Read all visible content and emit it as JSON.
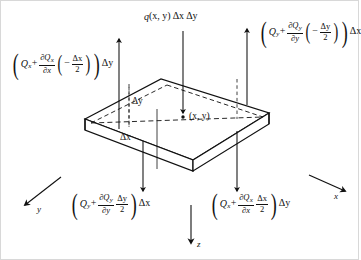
{
  "figure": {
    "background": "#ffffff",
    "stroke": "#111111",
    "width": 359,
    "height": 260
  },
  "load": {
    "label_plain": "q(x, y) Δx Δy",
    "symbol": "q",
    "args": "(x, y)",
    "factor1": "Δx",
    "factor2": "Δy",
    "direction": "down"
  },
  "forces": {
    "left": {
      "name": "shear-force-x-minus",
      "base": "Q",
      "sub": "x",
      "partial_num": "∂Q",
      "partial_num_sub": "x",
      "partial_den": "∂x",
      "offset_num": "Δx",
      "offset_den": "2",
      "offset_sign": "−",
      "multiplier": "Δy",
      "direction": "up",
      "plain": "(Q_x + ∂Q_x/∂x (−Δx/2)) Δy"
    },
    "top_right": {
      "name": "shear-force-y-minus",
      "base": "Q",
      "sub": "y",
      "partial_num": "∂Q",
      "partial_num_sub": "y",
      "partial_den": "∂y",
      "offset_num": "Δy",
      "offset_den": "2",
      "offset_sign": "−",
      "multiplier": "Δx",
      "direction": "up",
      "plain": "(Q_y + ∂Q_y/∂y (−Δy/2)) Δx"
    },
    "bottom_left": {
      "name": "shear-force-y-plus",
      "base": "Q",
      "sub": "y",
      "partial_num": "∂Q",
      "partial_num_sub": "y",
      "partial_den": "∂y",
      "offset_num": "Δy",
      "offset_den": "2",
      "offset_sign": "",
      "multiplier": "Δx",
      "direction": "down",
      "plain": "(Q_y + ∂Q_y/∂y Δy/2) Δx"
    },
    "bottom_right": {
      "name": "shear-force-x-plus",
      "base": "Q",
      "sub": "x",
      "partial_num": "∂Q",
      "partial_num_sub": "x",
      "partial_den": "∂x",
      "offset_num": "Δx",
      "offset_den": "2",
      "offset_sign": "",
      "multiplier": "Δy",
      "direction": "down",
      "plain": "(Q_x + ∂Q_x/∂x Δx/2) Δy"
    }
  },
  "dimensions": {
    "dx": "Δx",
    "dy": "Δy"
  },
  "center_point": {
    "label": "(x, y)"
  },
  "axes": {
    "x": {
      "label": "x",
      "direction": "lower-right"
    },
    "y": {
      "label": "y",
      "direction": "lower-left"
    },
    "z": {
      "label": "z",
      "direction": "down"
    }
  }
}
